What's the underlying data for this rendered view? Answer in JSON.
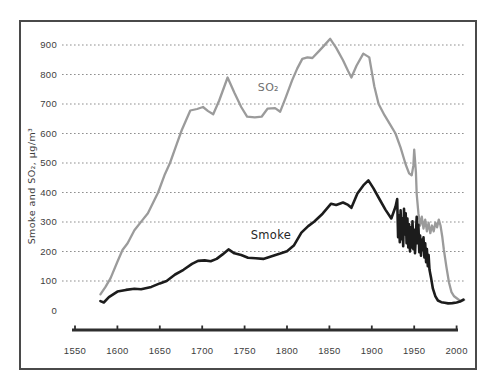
{
  "figure": {
    "ylabel": "Smoke and SO₂, µg/m³"
  },
  "chart_data": {
    "type": "line",
    "title": "",
    "xlabel": "",
    "ylabel": "Smoke and SO₂, µg/m³",
    "xlim": [
      1550,
      2010
    ],
    "ylim": [
      0,
      950
    ],
    "x_ticks": [
      1550,
      1600,
      1650,
      1700,
      1750,
      1800,
      1850,
      1900,
      1950,
      2000
    ],
    "y_ticks": [
      0,
      100,
      200,
      300,
      400,
      500,
      600,
      700,
      800,
      900
    ],
    "grid": "horizontal-dotted",
    "legend_position": "inline-labels",
    "colors": {
      "so2_line": "#9b9b9b",
      "smoke_line": "#1c1c1c",
      "axis": "#2e2e2e",
      "tick_label": "#3d3d3d",
      "gridline": "#909090"
    },
    "annotations": [
      {
        "text": "SO₂",
        "x": 1778,
        "y": 745,
        "color": "#6f6f6f",
        "size": 11
      },
      {
        "text": "Smoke",
        "x": 1781,
        "y": 243,
        "color": "#262626",
        "size": 11.5
      }
    ],
    "series": [
      {
        "name": "SO₂",
        "color": "#9b9b9b",
        "width": 2.3,
        "points": [
          [
            1580,
            55
          ],
          [
            1586,
            80
          ],
          [
            1592,
            110
          ],
          [
            1600,
            165
          ],
          [
            1606,
            205
          ],
          [
            1612,
            228
          ],
          [
            1620,
            272
          ],
          [
            1630,
            308
          ],
          [
            1636,
            330
          ],
          [
            1648,
            400
          ],
          [
            1656,
            462
          ],
          [
            1662,
            500
          ],
          [
            1670,
            565
          ],
          [
            1676,
            612
          ],
          [
            1686,
            678
          ],
          [
            1694,
            683
          ],
          [
            1701,
            690
          ],
          [
            1707,
            676
          ],
          [
            1713,
            665
          ],
          [
            1720,
            712
          ],
          [
            1730,
            790
          ],
          [
            1738,
            738
          ],
          [
            1746,
            690
          ],
          [
            1753,
            657
          ],
          [
            1762,
            655
          ],
          [
            1770,
            657
          ],
          [
            1777,
            684
          ],
          [
            1786,
            686
          ],
          [
            1792,
            674
          ],
          [
            1798,
            718
          ],
          [
            1806,
            780
          ],
          [
            1812,
            820
          ],
          [
            1818,
            853
          ],
          [
            1824,
            858
          ],
          [
            1830,
            856
          ],
          [
            1838,
            880
          ],
          [
            1845,
            902
          ],
          [
            1851,
            921
          ],
          [
            1858,
            890
          ],
          [
            1866,
            848
          ],
          [
            1872,
            812
          ],
          [
            1876,
            790
          ],
          [
            1882,
            830
          ],
          [
            1890,
            871
          ],
          [
            1897,
            858
          ],
          [
            1903,
            760
          ],
          [
            1908,
            700
          ],
          [
            1915,
            662
          ],
          [
            1922,
            628
          ],
          [
            1928,
            600
          ],
          [
            1934,
            552
          ],
          [
            1940,
            495
          ],
          [
            1944,
            465
          ],
          [
            1947,
            458
          ],
          [
            1949,
            492
          ],
          [
            1950,
            545
          ],
          [
            1952,
            470
          ],
          [
            1953,
            395
          ],
          [
            1955,
            330
          ],
          [
            1957,
            288
          ],
          [
            1959,
            318
          ],
          [
            1961,
            278
          ],
          [
            1963,
            308
          ],
          [
            1965,
            268
          ],
          [
            1967,
            298
          ],
          [
            1969,
            262
          ],
          [
            1971,
            288
          ],
          [
            1973,
            268
          ],
          [
            1975,
            298
          ],
          [
            1977,
            282
          ],
          [
            1979,
            308
          ],
          [
            1981,
            288
          ],
          [
            1983,
            252
          ],
          [
            1985,
            205
          ],
          [
            1988,
            148
          ],
          [
            1991,
            95
          ],
          [
            1994,
            62
          ],
          [
            1997,
            48
          ],
          [
            2001,
            40
          ],
          [
            2005,
            32
          ],
          [
            2009,
            36
          ]
        ]
      },
      {
        "name": "Smoke",
        "color": "#1c1c1c",
        "width": 2.6,
        "points": [
          [
            1580,
            32
          ],
          [
            1584,
            27
          ],
          [
            1590,
            45
          ],
          [
            1600,
            64
          ],
          [
            1610,
            70
          ],
          [
            1620,
            74
          ],
          [
            1628,
            72
          ],
          [
            1640,
            80
          ],
          [
            1650,
            92
          ],
          [
            1658,
            100
          ],
          [
            1668,
            122
          ],
          [
            1678,
            138
          ],
          [
            1688,
            158
          ],
          [
            1695,
            168
          ],
          [
            1703,
            170
          ],
          [
            1710,
            167
          ],
          [
            1717,
            175
          ],
          [
            1724,
            190
          ],
          [
            1731,
            207
          ],
          [
            1738,
            194
          ],
          [
            1746,
            188
          ],
          [
            1754,
            179
          ],
          [
            1763,
            177
          ],
          [
            1772,
            175
          ],
          [
            1782,
            184
          ],
          [
            1792,
            193
          ],
          [
            1800,
            201
          ],
          [
            1808,
            220
          ],
          [
            1817,
            264
          ],
          [
            1825,
            286
          ],
          [
            1832,
            301
          ],
          [
            1842,
            328
          ],
          [
            1852,
            362
          ],
          [
            1858,
            358
          ],
          [
            1866,
            366
          ],
          [
            1872,
            358
          ],
          [
            1876,
            348
          ],
          [
            1883,
            397
          ],
          [
            1890,
            424
          ],
          [
            1896,
            441
          ],
          [
            1902,
            414
          ],
          [
            1909,
            378
          ],
          [
            1916,
            342
          ],
          [
            1923,
            312
          ],
          [
            1928,
            352
          ],
          [
            1930,
            378
          ],
          [
            1931,
            248
          ],
          [
            1932,
            322
          ],
          [
            1933,
            232
          ],
          [
            1934,
            340
          ],
          [
            1935,
            242
          ],
          [
            1936,
            312
          ],
          [
            1937,
            218
          ],
          [
            1938,
            345
          ],
          [
            1939,
            258
          ],
          [
            1940,
            330
          ],
          [
            1941,
            228
          ],
          [
            1942,
            312
          ],
          [
            1943,
            214
          ],
          [
            1944,
            292
          ],
          [
            1945,
            200
          ],
          [
            1946,
            282
          ],
          [
            1947,
            214
          ],
          [
            1948,
            302
          ],
          [
            1949,
            208
          ],
          [
            1950,
            274
          ],
          [
            1951,
            194
          ],
          [
            1952,
            258
          ],
          [
            1953,
            318
          ],
          [
            1954,
            228
          ],
          [
            1955,
            290
          ],
          [
            1956,
            198
          ],
          [
            1957,
            254
          ],
          [
            1958,
            186
          ],
          [
            1959,
            240
          ],
          [
            1960,
            206
          ],
          [
            1961,
            248
          ],
          [
            1962,
            180
          ],
          [
            1963,
            228
          ],
          [
            1964,
            164
          ],
          [
            1965,
            208
          ],
          [
            1966,
            150
          ],
          [
            1967,
            188
          ],
          [
            1968,
            138
          ],
          [
            1970,
            108
          ],
          [
            1972,
            74
          ],
          [
            1975,
            48
          ],
          [
            1978,
            34
          ],
          [
            1982,
            28
          ],
          [
            1986,
            26
          ],
          [
            1990,
            24
          ],
          [
            1995,
            25
          ],
          [
            2000,
            27
          ],
          [
            2004,
            30
          ],
          [
            2008,
            37
          ]
        ]
      }
    ]
  }
}
